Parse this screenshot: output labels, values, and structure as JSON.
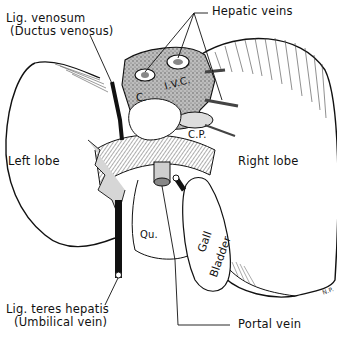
{
  "diagram": {
    "colors": {
      "ink": "#111111",
      "stipple": "#9a9a9a",
      "paper": "#ffffff"
    },
    "labels": {
      "lig_venosum": "Lig. venosum",
      "ductus_venosus": "(Ductus venosus)",
      "hepatic_veins": "Hepatic veins",
      "ivc_c": "C.",
      "ivc_ivc": "I.V.C.",
      "caudate_process": "C.P.",
      "left_lobe": "Left lobe",
      "right_lobe": "Right lobe",
      "quadrate": "Qu.",
      "gall": "Gall",
      "bladder": "Bladder",
      "lig_teres": "Lig. teres hepatis",
      "umbilical_vein": "(Umbilical vein)",
      "portal_vein": "Portal vein",
      "signature": "N.P."
    }
  }
}
